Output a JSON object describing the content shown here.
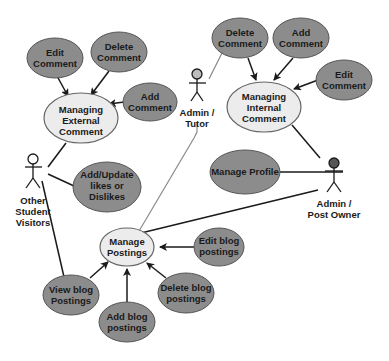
{
  "colors": {
    "sub_use_case_fill": "#8c8c8c",
    "main_use_case_fill": "#ececec",
    "stroke": "#555555",
    "line": "#1a1a1a",
    "light_line": "#8a8a8a"
  },
  "actors": {
    "admin_tutor": {
      "label_lines": [
        "Admin /",
        "Tutor"
      ]
    },
    "other_visitors": {
      "label_lines": [
        "Other",
        "Student",
        "Visitors"
      ]
    },
    "admin_post_owner": {
      "label_lines": [
        "Admin /",
        "Post Owner"
      ]
    }
  },
  "use_cases": {
    "managing_external": {
      "lines": [
        "Managing",
        "External",
        "Comment"
      ]
    },
    "managing_internal": {
      "lines": [
        "Managing",
        "Internal",
        "Comment"
      ]
    },
    "manage_postings": {
      "lines": [
        "Manage",
        "Postings"
      ]
    },
    "ext_edit_comment": {
      "lines": [
        "Edit",
        "Comment"
      ]
    },
    "ext_delete_comment": {
      "lines": [
        "Delete",
        "Comment"
      ]
    },
    "ext_add_comment": {
      "lines": [
        "Add",
        "Comment"
      ]
    },
    "int_delete_comment": {
      "lines": [
        "Delete",
        "Comment"
      ]
    },
    "int_add_comment": {
      "lines": [
        "Add",
        "Comment"
      ]
    },
    "int_edit_comment": {
      "lines": [
        "Edit",
        "Comment"
      ]
    },
    "add_update_likes": {
      "lines": [
        "Add/Update",
        "likes or",
        "Dislikes"
      ]
    },
    "manage_profile": {
      "lines": [
        "Manage Profile"
      ]
    },
    "view_blog": {
      "lines": [
        "View blog",
        "Postings"
      ]
    },
    "add_blog": {
      "lines": [
        "Add blog",
        "postings"
      ]
    },
    "delete_blog": {
      "lines": [
        "Delete blog",
        "postings"
      ]
    },
    "edit_blog": {
      "lines": [
        "Edit blog",
        "postings"
      ]
    }
  }
}
